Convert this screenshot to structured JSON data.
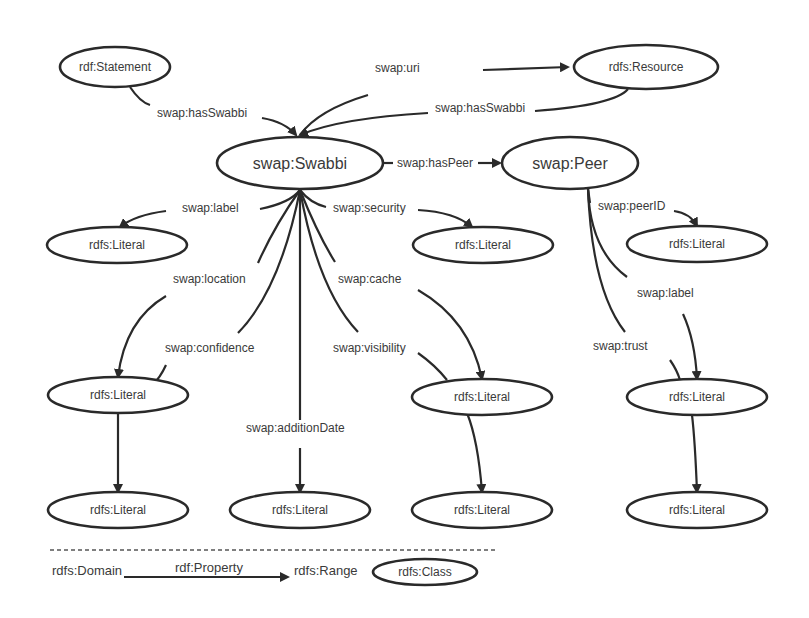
{
  "colors": {
    "stroke": "#2a2a2a",
    "text": "#3a3a3a",
    "background": "#ffffff"
  },
  "nodes": [
    {
      "id": "statement",
      "label": "rdf:Statement",
      "cx": 115,
      "cy": 67,
      "rx": 55,
      "ry": 20,
      "fs": 12
    },
    {
      "id": "resource",
      "label": "rdfs:Resource",
      "cx": 646,
      "cy": 67,
      "rx": 72,
      "ry": 22,
      "fs": 12
    },
    {
      "id": "swabbi",
      "label": "swap:Swabbi",
      "cx": 300,
      "cy": 163,
      "rx": 83,
      "ry": 26,
      "fs": 16
    },
    {
      "id": "peer",
      "label": "swap:Peer",
      "cx": 570,
      "cy": 163,
      "rx": 68,
      "ry": 26,
      "fs": 16
    },
    {
      "id": "lit_label",
      "label": "rdfs:Literal",
      "cx": 117,
      "cy": 245,
      "rx": 70,
      "ry": 18,
      "fs": 12
    },
    {
      "id": "lit_security",
      "label": "rdfs:Literal",
      "cx": 483,
      "cy": 245,
      "rx": 70,
      "ry": 18,
      "fs": 12
    },
    {
      "id": "lit_peerid",
      "label": "rdfs:Literal",
      "cx": 697,
      "cy": 244,
      "rx": 70,
      "ry": 18,
      "fs": 12
    },
    {
      "id": "lit_location",
      "label": "rdfs:Literal",
      "cx": 118,
      "cy": 395,
      "rx": 70,
      "ry": 18,
      "fs": 12
    },
    {
      "id": "lit_cache",
      "label": "rdfs:Literal",
      "cx": 482,
      "cy": 397,
      "rx": 70,
      "ry": 18,
      "fs": 12
    },
    {
      "id": "lit_peerlabel",
      "label": "rdfs:Literal",
      "cx": 697,
      "cy": 397,
      "rx": 70,
      "ry": 18,
      "fs": 12
    },
    {
      "id": "lit_confidence",
      "label": "rdfs:Literal",
      "cx": 118,
      "cy": 510,
      "rx": 70,
      "ry": 18,
      "fs": 12
    },
    {
      "id": "lit_additiondate",
      "label": "rdfs:Literal",
      "cx": 300,
      "cy": 510,
      "rx": 70,
      "ry": 18,
      "fs": 12
    },
    {
      "id": "lit_visibility",
      "label": "rdfs:Literal",
      "cx": 482,
      "cy": 510,
      "rx": 70,
      "ry": 18,
      "fs": 12
    },
    {
      "id": "lit_trust",
      "label": "rdfs:Literal",
      "cx": 697,
      "cy": 510,
      "rx": 70,
      "ry": 18,
      "fs": 12
    }
  ],
  "edges": [
    {
      "id": "statement-hasswabbi",
      "label": "swap:hasSwabbi",
      "lx": 157,
      "ly": 117,
      "d": "M130 87 Q140 102 150 105",
      "d2": "M262 118 Q285 122 296 135",
      "arrow": true
    },
    {
      "id": "resource-uri",
      "label": "swap:uri",
      "lx": 375,
      "ly": 72,
      "d": "M368 95 Q318 110 300 135",
      "d2": "M483 70 L568 67",
      "arrow": true
    },
    {
      "id": "resource-hasswabbi",
      "label": "swap:hasSwabbi",
      "lx": 435,
      "ly": 112,
      "d": "M628 89 Q615 105 535 111",
      "d2": "M428 113 Q340 118 300 135",
      "arrow": true
    },
    {
      "id": "swabbi-haspeer",
      "label": "swap:hasPeer",
      "lx": 397,
      "ly": 167,
      "d": "M383 163 L393 163",
      "d2": "M478 163 L500 163",
      "arrow": true
    },
    {
      "id": "swabbi-label",
      "label": "swap:label",
      "lx": 182,
      "ly": 212,
      "d": "M260 209 Q290 203 300 190",
      "d2": "M166 211 Q135 215 120 227",
      "arrow": true
    },
    {
      "id": "swabbi-security",
      "label": "swap:security",
      "lx": 333,
      "ly": 212,
      "d": "M300 190 Q310 203 326 207",
      "d2": "M418 210 Q455 212 472 227",
      "arrow": true
    },
    {
      "id": "swabbi-location",
      "label": "swap:location",
      "lx": 173,
      "ly": 283,
      "d": "M300 190 Q275 225 258 263",
      "d2": "M166 296 Q125 320 118 377",
      "arrow": true
    },
    {
      "id": "swabbi-confidence",
      "label": "swap:confidence",
      "lx": 165,
      "ly": 352,
      "d": "M300 190 Q280 290 238 333",
      "d2": "M166 365 Q160 378 153 384",
      "arrow": false
    },
    {
      "id": "swabbi-additiondate",
      "label": "swap:additionDate",
      "lx": 246,
      "ly": 432,
      "d": "M300 190 L300 420",
      "d2": "M300 448 L300 492",
      "arrow": true
    },
    {
      "id": "swabbi-cache",
      "label": "swap:cache",
      "lx": 338,
      "ly": 283,
      "d": "M300 190 Q318 235 335 262",
      "d2": "M418 290 Q470 320 482 379",
      "arrow": true
    },
    {
      "id": "swabbi-visibility",
      "label": "swap:visibility",
      "lx": 333,
      "ly": 352,
      "d": "M300 190 Q318 290 358 332",
      "d2": "M418 353 Q435 365 447 380",
      "arrow": false
    },
    {
      "id": "peer-peerid",
      "label": "swap:peerID",
      "lx": 598,
      "ly": 210,
      "d": "M588 189 L590 203",
      "d2": "M674 211 Q690 213 697 226",
      "arrow": true
    },
    {
      "id": "peer-label",
      "label": "swap:label",
      "lx": 637,
      "ly": 297,
      "d": "M588 189 Q590 250 627 277",
      "d2": "M683 314 Q695 340 697 379",
      "arrow": true
    },
    {
      "id": "peer-trust",
      "label": "swap:trust",
      "lx": 593,
      "ly": 350,
      "d": "M588 189 Q592 290 625 332",
      "d2": "M670 360 Q677 370 680 380",
      "arrow": false
    },
    {
      "id": "location-confidence",
      "label": "",
      "lx": 0,
      "ly": 0,
      "d": "M118 413 Q118 430 118 492",
      "d2": "",
      "arrow": true
    },
    {
      "id": "cache-visibility",
      "label": "",
      "lx": 0,
      "ly": 0,
      "d": "M467 413 Q478 440 482 492",
      "d2": "",
      "arrow": true
    },
    {
      "id": "peerlabel-trust",
      "label": "",
      "lx": 0,
      "ly": 0,
      "d": "M692 415 Q695 440 697 492",
      "d2": "",
      "arrow": true
    }
  ],
  "legend": {
    "domain_label": "rdfs:Domain",
    "property_label": "rdf:Property",
    "range_label": "rdfs:Range",
    "class_label": "rdfs:Class"
  }
}
